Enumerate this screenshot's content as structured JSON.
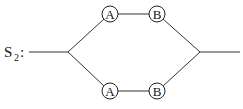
{
  "system": {
    "label_main": "S",
    "label_sub": "2",
    "label_colon": ":"
  },
  "branches": [
    {
      "name": "upper",
      "components": [
        {
          "label": "A",
          "cx": 110,
          "cy": 14
        },
        {
          "label": "B",
          "cx": 157,
          "cy": 14
        }
      ]
    },
    {
      "name": "lower",
      "components": [
        {
          "label": "A",
          "cx": 110,
          "cy": 91
        },
        {
          "label": "B",
          "cx": 157,
          "cy": 91
        }
      ]
    }
  ],
  "colors": {
    "line": "#333333",
    "text": "#111111",
    "background": "#ffffff"
  }
}
